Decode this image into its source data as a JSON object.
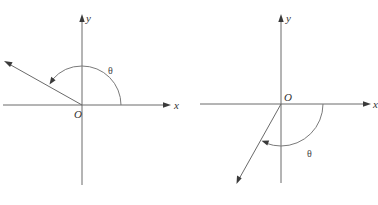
{
  "figure": {
    "colors": {
      "background": "#ffffff",
      "line": "#6a6a6a",
      "arrowhead": "#3a3a3a",
      "text": "#333333"
    },
    "panels": [
      {
        "id": "a",
        "x_label": "x",
        "y_label": "y",
        "origin_label": "O",
        "angle_label": "θ",
        "angle_direction": "counterclockwise",
        "angle_sign": "positive",
        "terminal_quadrant": "II",
        "caption": ""
      },
      {
        "id": "b",
        "x_label": "x",
        "y_label": "y",
        "origin_label": "O",
        "angle_label": "θ",
        "angle_direction": "clockwise",
        "angle_sign": "negative",
        "terminal_quadrant": "III",
        "caption": ""
      }
    ]
  }
}
